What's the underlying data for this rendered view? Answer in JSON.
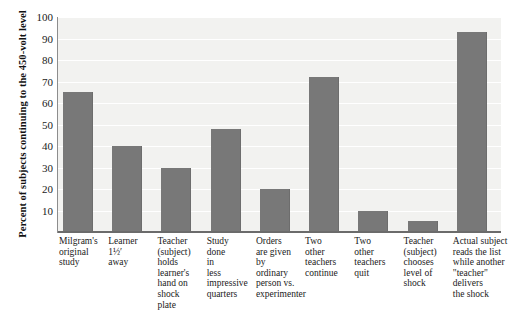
{
  "chart_data": {
    "type": "bar",
    "title": "",
    "xlabel": "",
    "ylabel": "Percent of subjects continuing to the 450-volt level",
    "ylim": [
      0,
      100
    ],
    "ytick_labels": [
      "100",
      "90",
      "80",
      "70",
      "60",
      "50",
      "40",
      "30",
      "20",
      "10"
    ],
    "yticks": [
      100,
      90,
      80,
      70,
      60,
      50,
      40,
      30,
      20,
      10
    ],
    "grid": true,
    "legend": "none",
    "bar_color": "#787878",
    "plot_background": "#f2f2f0",
    "categories": [
      "Milgram's\noriginal\nstudy",
      "Learner\n1½′\naway",
      "Teacher\n(subject)\nholds\nlearner's\nhand on\nshock\nplate",
      "Study\ndone\nin\nless\nimpressive\nquarters",
      "Orders\nare given\nby\nordinary\nperson vs.\nexperimenter",
      "Two\nother\nteachers\ncontinue",
      "Two\nother\nteachers\nquit",
      "Teacher\n(subject)\nchooses\nlevel of\nshock",
      "Actual subject\nreads the list\nwhile another\n\"teacher\"\ndelivers\nthe shock"
    ],
    "values": [
      65,
      40,
      30,
      48,
      20,
      72,
      10,
      5,
      93
    ]
  }
}
